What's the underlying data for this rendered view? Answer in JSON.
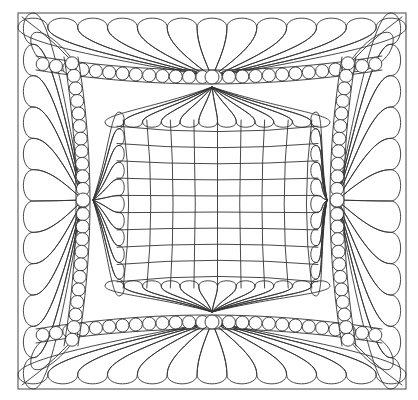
{
  "artwork": {
    "subject": "quilting-pattern-line-art",
    "colors": {
      "background": "#ffffff",
      "line": "#333333",
      "frame": "#555555"
    },
    "frame": {
      "x": 18,
      "y": 13,
      "width": 388,
      "height": 376
    },
    "center_grid": {
      "vertical_lines": 9,
      "horizontal_lines": 10,
      "bounds": {
        "x1": 125,
        "y1": 128,
        "x2": 310,
        "y2": 280
      }
    },
    "pearl_band": {
      "inset": 62,
      "pearl_radius": 6.5,
      "knots": [
        {
          "side": "top",
          "x": 212,
          "y": 77
        },
        {
          "side": "bottom",
          "x": 212,
          "y": 322
        },
        {
          "side": "left",
          "x": 83,
          "y": 200
        },
        {
          "side": "right",
          "x": 337,
          "y": 200
        }
      ]
    },
    "feathers": {
      "outer_top_count": 13,
      "outer_side_count": 12,
      "inner_top_count": 12,
      "inner_side_count": 11
    }
  }
}
